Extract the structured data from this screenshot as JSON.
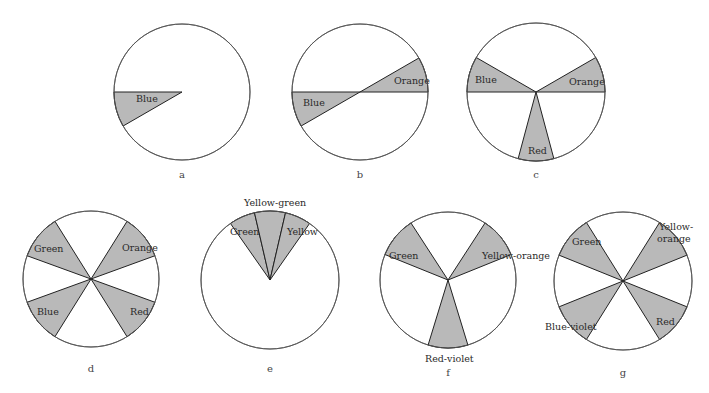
{
  "figure": {
    "fill_color": "#b9b9b9",
    "line_color": "#222222",
    "panels": [
      {
        "id": "a",
        "caption": "a",
        "cx": 182,
        "cy": 92,
        "r": 68,
        "wedges": [
          {
            "label": "Blue",
            "start": 180,
            "end": 210,
            "lx": 136,
            "ly": 102
          }
        ]
      },
      {
        "id": "b",
        "caption": "b",
        "cx": 360,
        "cy": 92,
        "r": 68,
        "wedges": [
          {
            "label": "Blue",
            "start": 180,
            "end": 210,
            "lx": 303,
            "ly": 106
          },
          {
            "label": "Orange",
            "start": 0,
            "end": 30,
            "lx": 394,
            "ly": 84
          }
        ]
      },
      {
        "id": "c",
        "caption": "c",
        "cx": 536,
        "cy": 92,
        "r": 69,
        "wedges": [
          {
            "label": "Blue",
            "start": 150,
            "end": 180,
            "lx": 475,
            "ly": 83
          },
          {
            "label": "Orange",
            "start": 0,
            "end": 30,
            "lx": 569,
            "ly": 85
          },
          {
            "label": "Red",
            "start": 255,
            "end": 285,
            "lx": 528,
            "ly": 154
          }
        ]
      },
      {
        "id": "d",
        "caption": "d",
        "cx": 91,
        "cy": 279,
        "r": 68,
        "wedges": [
          {
            "label": "Green",
            "start": 122,
            "end": 160,
            "lx": 34,
            "ly": 252
          },
          {
            "label": "Orange",
            "start": 20,
            "end": 58,
            "lx": 122,
            "ly": 251
          },
          {
            "label": "Blue",
            "start": 200,
            "end": 238,
            "lx": 37,
            "ly": 315
          },
          {
            "label": "Red",
            "start": 302,
            "end": 340,
            "lx": 130,
            "ly": 315
          }
        ]
      },
      {
        "id": "e",
        "caption": "e",
        "cx": 270,
        "cy": 280,
        "r": 69,
        "wedges": [
          {
            "label": "Green",
            "start": 103,
            "end": 125,
            "lx": 230,
            "ly": 235
          },
          {
            "label": "Yellow-green",
            "start": 77,
            "end": 103,
            "lx": 244,
            "ly": 206
          },
          {
            "label": "Yellow",
            "start": 55,
            "end": 77,
            "lx": 287,
            "ly": 235
          }
        ]
      },
      {
        "id": "f",
        "caption": "f",
        "cx": 448,
        "cy": 280,
        "r": 68,
        "wedges": [
          {
            "label": "Green",
            "start": 123,
            "end": 158,
            "lx": 389,
            "ly": 259
          },
          {
            "label": "Yellow-orange",
            "start": 22,
            "end": 57,
            "lx": 482,
            "ly": 259
          },
          {
            "label": "Red-violet",
            "start": 253,
            "end": 287,
            "lx": 425,
            "ly": 362
          }
        ]
      },
      {
        "id": "g",
        "caption": "g",
        "cx": 623,
        "cy": 281,
        "r": 69,
        "wedges": [
          {
            "label": "Green",
            "start": 122,
            "end": 158,
            "lx": 572,
            "ly": 245
          },
          {
            "label": "Yellow-",
            "start": 22,
            "end": 58,
            "lx": 659,
            "ly": 230
          },
          {
            "label": "Blue-violet",
            "start": 202,
            "end": 238,
            "lx": 545,
            "ly": 330
          },
          {
            "label": "Red",
            "start": 302,
            "end": 338,
            "lx": 656,
            "ly": 325
          }
        ],
        "extra_labels": [
          {
            "text": "orange",
            "x": 657,
            "y": 242
          }
        ]
      }
    ],
    "captions_pos": {
      "a": [
        182,
        178
      ],
      "b": [
        360,
        178
      ],
      "c": [
        536,
        178
      ],
      "d": [
        91,
        372
      ],
      "e": [
        270,
        372
      ],
      "f": [
        448,
        376
      ],
      "g": [
        623,
        376
      ]
    }
  }
}
